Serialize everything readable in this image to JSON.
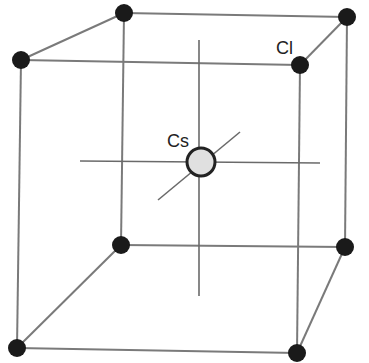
{
  "diagram": {
    "labels": {
      "cs": "Cs",
      "cl": "Cl"
    },
    "colors": {
      "edge": "#7a7a7a",
      "corner_atom": "#1a1a1a",
      "center_atom_fill": "#e0e0e0",
      "center_atom_stroke": "#222222"
    },
    "corner_atoms": [
      {
        "name": "back-top-left",
        "x": 124,
        "y": 13
      },
      {
        "name": "back-top-right",
        "x": 347,
        "y": 17
      },
      {
        "name": "front-top-left",
        "x": 21,
        "y": 60
      },
      {
        "name": "front-top-right",
        "x": 300,
        "y": 65
      },
      {
        "name": "back-bottom-left",
        "x": 121,
        "y": 245
      },
      {
        "name": "back-bottom-right",
        "x": 345,
        "y": 247
      },
      {
        "name": "front-bottom-left",
        "x": 17,
        "y": 348
      },
      {
        "name": "front-bottom-right",
        "x": 297,
        "y": 353
      }
    ],
    "center_atom": {
      "x": 201,
      "y": 162
    }
  }
}
